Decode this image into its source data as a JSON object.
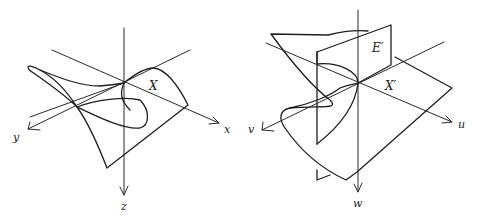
{
  "figure_left": {
    "surface_label": "X",
    "axes": {
      "x": "x",
      "y": "y",
      "z": "z"
    }
  },
  "figure_right": {
    "surface_label": "X′",
    "plane_label": "E′",
    "axes": {
      "u": "u",
      "v": "v",
      "w": "w"
    }
  },
  "colors": {
    "ink": "#222222",
    "background": "#ffffff"
  }
}
